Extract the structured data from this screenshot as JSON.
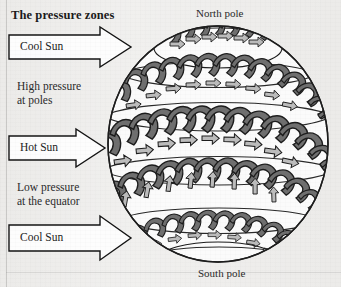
{
  "figure": {
    "title": "The pressure zones",
    "background_color": "#ecebe9",
    "ink_color": "#1b1b1b"
  },
  "labels": {
    "north_pole": "North pole",
    "south_pole": "South pole",
    "high_pressure": "High pressure",
    "high_pressure_line2": "at poles",
    "low_pressure": "Low pressure",
    "low_pressure_line2": "at the equator"
  },
  "arrows": [
    {
      "id": "cool-sun-top",
      "label": "Cool Sun"
    },
    {
      "id": "hot-sun-middle",
      "label": "Hot Sun"
    },
    {
      "id": "cool-sun-bottom",
      "label": "Cool Sun"
    }
  ],
  "globe": {
    "dark_cell_color": "#6f6f6f",
    "light_arrow_color": "#bcbcbc",
    "outline_color": "#1d1d1d",
    "surface_color": "#fbfbfb",
    "band_count": 5,
    "bands": [
      {
        "name": "north-polar-cell",
        "cells": 9
      },
      {
        "name": "north-ferrel-cell",
        "cells": 14
      },
      {
        "name": "equatorial-hadley-cell",
        "cells": 14
      },
      {
        "name": "south-ferrel-cell",
        "cells": 14
      },
      {
        "name": "south-polar-cell",
        "cells": 12
      }
    ]
  }
}
